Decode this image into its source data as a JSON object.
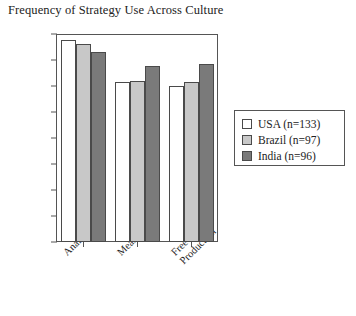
{
  "chart_data": {
    "type": "bar",
    "title": "Frequency of Strategy Use Across Culture",
    "xlabel": "",
    "ylabel": "",
    "categories": [
      "Analogy",
      "Means-End",
      "Free\nProduction"
    ],
    "series": [
      {
        "name": "USA (n=133)",
        "values": [
          3.88,
          3.08,
          3.0
        ],
        "color": "#ffffff"
      },
      {
        "name": "Brazil (n=97)",
        "values": [
          3.81,
          3.1,
          3.08
        ],
        "color": "#c8c8c8"
      },
      {
        "name": "India (n=96)",
        "values": [
          3.65,
          3.38,
          3.42
        ],
        "color": "#7a7a7a"
      }
    ],
    "ylim": [
      0,
      4.0
    ],
    "ytick_values": [
      4.0,
      3.5,
      3.0,
      2.5,
      2.0,
      1.5,
      1.0,
      0.5,
      0.0
    ],
    "ytick_labels": [
      "4.00",
      "3.50",
      "3.00",
      "2.50",
      "2.00",
      "1.50",
      "1.00",
      "0.50",
      "0.00"
    ],
    "grid": false,
    "legend_position": "right",
    "bar_outline_color": "#4a4a4a",
    "axis_color": "#555555"
  }
}
